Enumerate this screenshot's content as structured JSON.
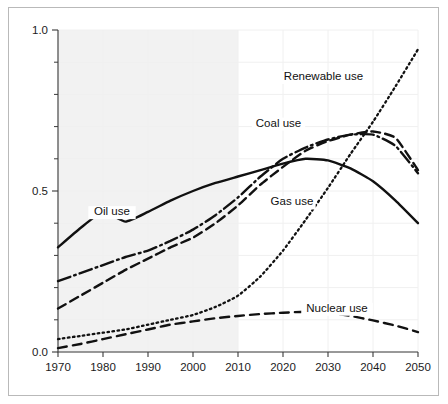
{
  "chart_data": {
    "type": "line",
    "title": "",
    "subtitle": "",
    "xlabel": "",
    "ylabel": "",
    "xlim": [
      1970,
      2050
    ],
    "ylim": [
      0.0,
      1.0
    ],
    "x_ticks": [
      1970,
      1980,
      1990,
      2000,
      2010,
      2020,
      2030,
      2040,
      2050
    ],
    "x_tick_labels": [
      "1970",
      "1980",
      "1990",
      "2000",
      "2010",
      "2020",
      "2030",
      "2040",
      "2050"
    ],
    "y_ticks": [
      0.0,
      0.5,
      1.0
    ],
    "y_tick_labels": [
      "0.0",
      "0.5",
      "1.0"
    ],
    "y_minor_ticks": [
      0.1,
      0.2,
      0.3,
      0.4,
      0.6,
      0.7,
      0.8,
      0.9
    ],
    "grid": true,
    "legend_position": "inline-annotations",
    "shaded_region": {
      "x_start": 1970,
      "x_end": 2010,
      "color": "#f2f2f2",
      "meaning": "historical"
    },
    "x": [
      1970,
      1975,
      1980,
      1985,
      1990,
      1995,
      2000,
      2005,
      2010,
      2015,
      2020,
      2025,
      2030,
      2035,
      2040,
      2045,
      2050
    ],
    "series": [
      {
        "name": "Oil use",
        "label": "Oil use",
        "line_style": "solid",
        "color": "#111111",
        "values": [
          0.325,
          0.385,
          0.435,
          0.405,
          0.435,
          0.47,
          0.5,
          0.525,
          0.545,
          0.565,
          0.585,
          0.6,
          0.595,
          0.57,
          0.53,
          0.47,
          0.4
        ],
        "label_x": 1982,
        "label_y": 0.425
      },
      {
        "name": "Gas use",
        "label": "Gas use",
        "line_style": "dashdot",
        "color": "#111111",
        "values": [
          0.22,
          0.245,
          0.27,
          0.295,
          0.315,
          0.345,
          0.38,
          0.425,
          0.48,
          0.545,
          0.6,
          0.635,
          0.66,
          0.675,
          0.675,
          0.64,
          0.555
        ],
        "label_x": 2022,
        "label_y": 0.455
      },
      {
        "name": "Coal use",
        "label": "Coal use",
        "line_style": "dashed",
        "color": "#111111",
        "values": [
          0.135,
          0.175,
          0.215,
          0.255,
          0.29,
          0.325,
          0.355,
          0.4,
          0.455,
          0.52,
          0.575,
          0.625,
          0.655,
          0.675,
          0.685,
          0.665,
          0.565
        ],
        "label_x": 2019,
        "label_y": 0.7
      },
      {
        "name": "Renewable use",
        "label": "Renewable use",
        "line_style": "dotted",
        "color": "#111111",
        "values": [
          0.04,
          0.05,
          0.06,
          0.07,
          0.085,
          0.1,
          0.115,
          0.14,
          0.175,
          0.235,
          0.315,
          0.41,
          0.51,
          0.615,
          0.715,
          0.825,
          0.94
        ],
        "label_x": 2029,
        "label_y": 0.845
      },
      {
        "name": "Nuclear use",
        "label": "Nuclear use",
        "line_style": "dashed-long",
        "color": "#111111",
        "values": [
          0.012,
          0.025,
          0.04,
          0.055,
          0.07,
          0.085,
          0.095,
          0.105,
          0.112,
          0.118,
          0.122,
          0.125,
          0.122,
          0.112,
          0.098,
          0.082,
          0.062
        ],
        "label_x": 2032,
        "label_y": 0.125
      }
    ]
  }
}
